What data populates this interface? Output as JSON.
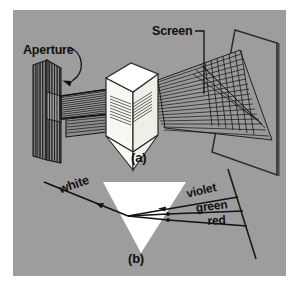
{
  "figure": {
    "background_color": "#9d9d9d",
    "border_color": "#ffffff",
    "ink_color": "#101010",
    "prism_color": "#fbfbf6",
    "panels": [
      {
        "id": "a",
        "caption": "(a)"
      },
      {
        "id": "b",
        "caption": "(b)"
      }
    ]
  },
  "panel_a": {
    "caption": "(a)",
    "labels": {
      "aperture": "Aperture",
      "screen": "Screen"
    },
    "elements": {
      "aperture_plate": "hatched-aperture-plate",
      "prism": "triangular-prism-3d",
      "screen_plane": "screen-quadrilateral",
      "incident_beam": "white-light-beam",
      "dispersed_beam": "fanned-spectrum-beam"
    }
  },
  "panel_b": {
    "caption": "(b)",
    "labels": {
      "incident": "white",
      "ray1": "violet",
      "ray2": "green",
      "ray3": "red"
    },
    "elements": {
      "prism": "inverted-triangle-prism",
      "screen_line": "slanted-screen-line",
      "incident_ray": "white-incident-ray",
      "dispersed_rays": [
        "violet",
        "green",
        "red"
      ]
    }
  }
}
